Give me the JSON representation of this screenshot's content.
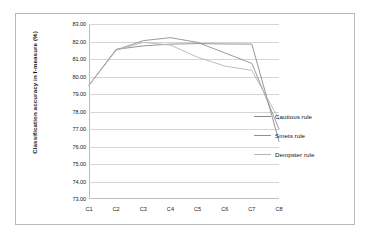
{
  "chart_data": {
    "type": "line",
    "title": "",
    "xlabel": "",
    "ylabel": "Classification accuracy in f-measure (%)",
    "categories": [
      "C1",
      "C2",
      "C3",
      "C4",
      "C5",
      "C6",
      "C7",
      "C8"
    ],
    "ylim": [
      73.0,
      83.0
    ],
    "ytick_step": 1.0,
    "ytick_labels": [
      "83.00",
      "82.00",
      "81.00",
      "80.00",
      "79.00",
      "78.00",
      "77.00",
      "76.00",
      "75.00",
      "74.00",
      "73.00"
    ],
    "ytick_values": [
      83.0,
      82.0,
      81.0,
      80.0,
      79.0,
      78.0,
      77.0,
      76.0,
      75.0,
      74.0,
      73.0
    ],
    "grid": true,
    "legend_position": "right",
    "series": [
      {
        "name": "Cautious rule",
        "color": "#8a8a8a",
        "values": [
          79.5,
          81.55,
          81.75,
          81.85,
          81.88,
          81.86,
          81.85,
          76.3
        ]
      },
      {
        "name": "Smets rule",
        "color": "#909090",
        "values": [
          79.5,
          81.52,
          82.05,
          82.22,
          81.95,
          81.35,
          80.75,
          77.0
        ]
      },
      {
        "name": "Dempster rule",
        "color": "#b6b6b6",
        "values": [
          79.5,
          81.5,
          81.95,
          81.8,
          81.1,
          80.6,
          80.35,
          77.55
        ]
      }
    ]
  },
  "legend": {
    "items": [
      {
        "label": "Cautious rule"
      },
      {
        "label": "Smets rule"
      },
      {
        "label": "Dempster rule"
      }
    ]
  }
}
